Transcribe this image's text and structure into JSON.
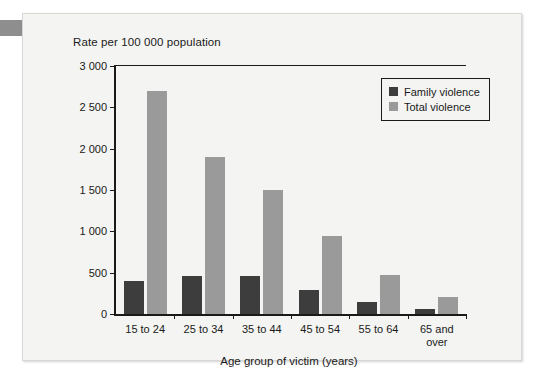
{
  "panel": {
    "background_color": "#f4f4f2",
    "corner_tab_color": "#8e8e8e"
  },
  "chart_data": {
    "type": "bar",
    "title": "Rate per 100 000 population",
    "xlabel": "Age group of victim (years)",
    "ylabel": "",
    "categories": [
      "15 to 24",
      "25 to 34",
      "35 to 44",
      "45 to 54",
      "55 to 64",
      "65 and\nover"
    ],
    "series": [
      {
        "name": "Family violence",
        "color": "#3d3d3d",
        "values": [
          400,
          460,
          455,
          285,
          150,
          60
        ]
      },
      {
        "name": "Total violence",
        "color": "#9a9a9a",
        "values": [
          2700,
          1900,
          1500,
          940,
          470,
          200
        ]
      }
    ],
    "ylim": [
      0,
      3000
    ],
    "yticks": [
      0,
      500,
      1000,
      1500,
      2000,
      2500,
      3000
    ],
    "ytick_labels": [
      "0",
      "500",
      "1 000",
      "1 500",
      "2 000",
      "2 500",
      "3 000"
    ],
    "grid": false,
    "legend_position": "top-right"
  }
}
